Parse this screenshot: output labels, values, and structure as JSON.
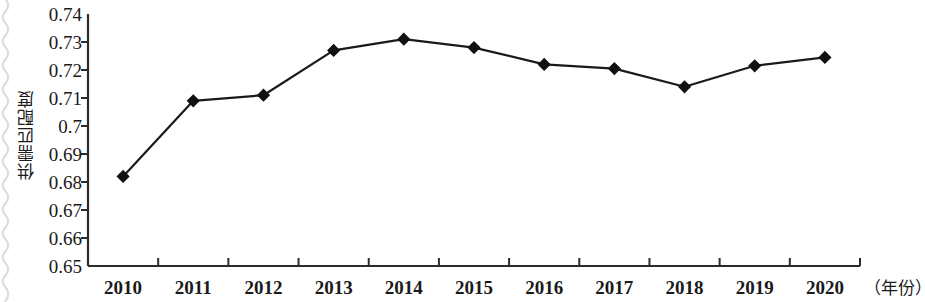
{
  "chart_data": {
    "type": "line",
    "title": "",
    "xlabel": "（年份）",
    "ylabel": "供需匹配度",
    "categories": [
      "2010",
      "2011",
      "2012",
      "2013",
      "2014",
      "2015",
      "2016",
      "2017",
      "2018",
      "2019",
      "2020"
    ],
    "values": [
      0.682,
      0.709,
      0.711,
      0.727,
      0.731,
      0.728,
      0.722,
      0.7205,
      0.714,
      0.7215,
      0.7245
    ],
    "series": [
      {
        "name": "供需匹配度",
        "values": [
          0.682,
          0.709,
          0.711,
          0.727,
          0.731,
          0.728,
          0.722,
          0.7205,
          0.714,
          0.7215,
          0.7245
        ]
      }
    ],
    "ylim": [
      0.65,
      0.74
    ],
    "ytick_step": 0.01,
    "ytick_labels": [
      "0.74",
      "0.73",
      "0.72",
      "0.71",
      "0.7",
      "0.69",
      "0.68",
      "0.67",
      "0.66",
      "0.65"
    ],
    "ytick_values": [
      0.74,
      0.73,
      0.72,
      0.71,
      0.7,
      0.69,
      0.68,
      0.67,
      0.66,
      0.65
    ],
    "grid": false,
    "legend": false,
    "legend_position": "none",
    "marker": "diamond",
    "line_color": "#1a1a1a",
    "marker_color": "#111111",
    "axis_color": "#2b2b2b"
  },
  "axes": {
    "y_title": "供需匹配度",
    "x_unit": "（年份）"
  }
}
